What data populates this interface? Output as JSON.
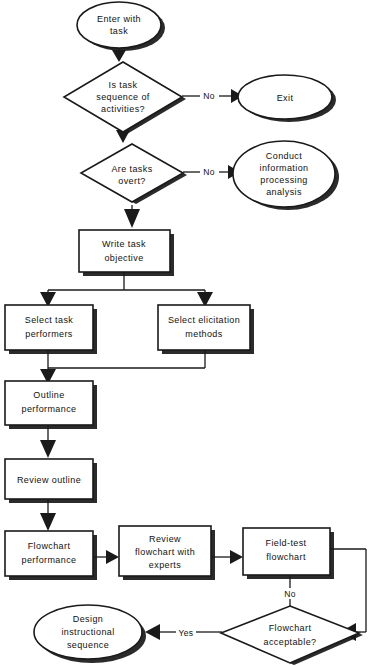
{
  "diagram": {
    "type": "flowchart",
    "nodes": [
      {
        "id": "enter",
        "shape": "ellipse",
        "lines": [
          "Enter with",
          "task"
        ]
      },
      {
        "id": "d1",
        "shape": "diamond",
        "lines": [
          "Is task",
          "sequence of",
          "activities?"
        ]
      },
      {
        "id": "exit",
        "shape": "ellipse",
        "lines": [
          "Exit"
        ]
      },
      {
        "id": "d2",
        "shape": "diamond",
        "lines": [
          "Are tasks",
          "overt?"
        ]
      },
      {
        "id": "conduct",
        "shape": "ellipse",
        "lines": [
          "Conduct",
          "information",
          "processing",
          "analysis"
        ]
      },
      {
        "id": "write",
        "shape": "box",
        "lines": [
          "Write task",
          "objective"
        ]
      },
      {
        "id": "performers",
        "shape": "box",
        "lines": [
          "Select task",
          "performers"
        ]
      },
      {
        "id": "elicitation",
        "shape": "box",
        "lines": [
          "Select  elicitation",
          "methods"
        ]
      },
      {
        "id": "outline",
        "shape": "box",
        "lines": [
          "Outline",
          "performance"
        ]
      },
      {
        "id": "review",
        "shape": "box",
        "lines": [
          "Review  outline"
        ]
      },
      {
        "id": "flowperf",
        "shape": "box",
        "lines": [
          "Flowchart",
          "performance"
        ]
      },
      {
        "id": "reviewflow",
        "shape": "box",
        "lines": [
          "Review",
          "flowchart  with",
          "experts"
        ]
      },
      {
        "id": "fieldtest",
        "shape": "box",
        "lines": [
          "Field-test",
          "flowchart"
        ]
      },
      {
        "id": "d3",
        "shape": "diamond",
        "lines": [
          "Flowchart",
          "acceptable?"
        ]
      },
      {
        "id": "design",
        "shape": "ellipse",
        "lines": [
          "Design",
          "instructional",
          "sequence"
        ]
      }
    ],
    "edge_labels": {
      "d1_no": "No",
      "d2_no": "No",
      "fieldtest_no": "No",
      "d3_yes": "Yes"
    },
    "colors": {
      "stroke": "#1a1a1a",
      "shadow": "#2b2b2b",
      "fill": "#ffffff",
      "background": "#ffffff"
    }
  }
}
